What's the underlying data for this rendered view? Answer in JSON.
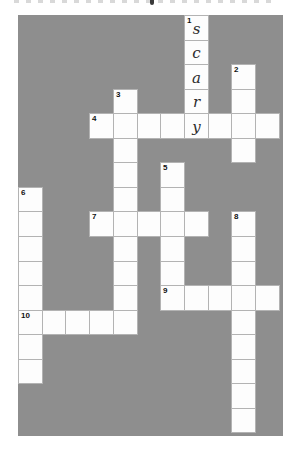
{
  "board": {
    "cols": 11,
    "rows": 17,
    "colors": {
      "background": "#8e8e8e",
      "cell_fill": "#fdfdfd",
      "cell_border": "#b3b3b3",
      "number_color": "#111111",
      "letter_color": "#2b2b2b"
    },
    "filled_word": "scary",
    "cells": [
      {
        "r": 0,
        "c": 7,
        "num": "1",
        "letter": "s"
      },
      {
        "r": 1,
        "c": 7,
        "letter": "c"
      },
      {
        "r": 2,
        "c": 7,
        "letter": "a"
      },
      {
        "r": 2,
        "c": 9,
        "num": "2"
      },
      {
        "r": 3,
        "c": 4,
        "num": "3"
      },
      {
        "r": 3,
        "c": 7,
        "letter": "r"
      },
      {
        "r": 3,
        "c": 9
      },
      {
        "r": 4,
        "c": 3,
        "num": "4"
      },
      {
        "r": 4,
        "c": 4
      },
      {
        "r": 4,
        "c": 5
      },
      {
        "r": 4,
        "c": 6
      },
      {
        "r": 4,
        "c": 7,
        "letter": "y"
      },
      {
        "r": 4,
        "c": 8
      },
      {
        "r": 4,
        "c": 9
      },
      {
        "r": 4,
        "c": 10
      },
      {
        "r": 5,
        "c": 4
      },
      {
        "r": 5,
        "c": 9
      },
      {
        "r": 6,
        "c": 4
      },
      {
        "r": 6,
        "c": 6,
        "num": "5"
      },
      {
        "r": 7,
        "c": 0,
        "num": "6"
      },
      {
        "r": 7,
        "c": 4
      },
      {
        "r": 7,
        "c": 6
      },
      {
        "r": 8,
        "c": 0
      },
      {
        "r": 8,
        "c": 3,
        "num": "7"
      },
      {
        "r": 8,
        "c": 4
      },
      {
        "r": 8,
        "c": 5
      },
      {
        "r": 8,
        "c": 6
      },
      {
        "r": 8,
        "c": 7
      },
      {
        "r": 8,
        "c": 9,
        "num": "8"
      },
      {
        "r": 9,
        "c": 0
      },
      {
        "r": 9,
        "c": 4
      },
      {
        "r": 9,
        "c": 6
      },
      {
        "r": 9,
        "c": 9
      },
      {
        "r": 10,
        "c": 0
      },
      {
        "r": 10,
        "c": 4
      },
      {
        "r": 10,
        "c": 6
      },
      {
        "r": 10,
        "c": 9
      },
      {
        "r": 11,
        "c": 0
      },
      {
        "r": 11,
        "c": 4
      },
      {
        "r": 11,
        "c": 6,
        "num": "9"
      },
      {
        "r": 11,
        "c": 7
      },
      {
        "r": 11,
        "c": 8
      },
      {
        "r": 11,
        "c": 9
      },
      {
        "r": 11,
        "c": 10
      },
      {
        "r": 12,
        "c": 0,
        "num": "10"
      },
      {
        "r": 12,
        "c": 1
      },
      {
        "r": 12,
        "c": 2
      },
      {
        "r": 12,
        "c": 3
      },
      {
        "r": 12,
        "c": 4
      },
      {
        "r": 12,
        "c": 9
      },
      {
        "r": 13,
        "c": 0
      },
      {
        "r": 13,
        "c": 9
      },
      {
        "r": 14,
        "c": 0
      },
      {
        "r": 14,
        "c": 9
      },
      {
        "r": 15,
        "c": 9
      },
      {
        "r": 16,
        "c": 9
      }
    ]
  }
}
